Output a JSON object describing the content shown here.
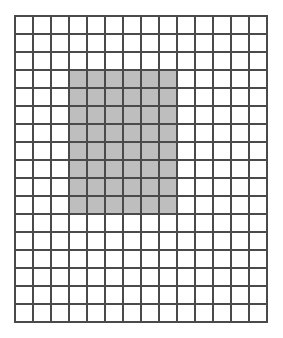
{
  "figure": {
    "name": "shaded-rectangle-on-grid",
    "type": "grid-diagram",
    "grid": {
      "columns": 14,
      "rows": 17,
      "total_cells": 238,
      "cell_size_px": 18,
      "origin_x_px": 15,
      "origin_y_px": 16,
      "width_px": 252,
      "height_px": 306
    },
    "shaded_region": {
      "label": "shaded-block",
      "start_column": 4,
      "end_column": 9,
      "start_row": 4,
      "end_row": 11,
      "columns_spanned": 6,
      "rows_spanned": 8,
      "shaded_cell_count": 48,
      "unshaded_cell_count": 190,
      "left_px": 69,
      "top_px": 70,
      "width_px": 108,
      "height_px": 144
    },
    "colors": {
      "background": "#ffffff",
      "grid_line": "#4a4a4a",
      "shaded_fill": "#bebebe",
      "unshaded_fill": "#ffffff",
      "border": "#4a4a4a"
    }
  }
}
